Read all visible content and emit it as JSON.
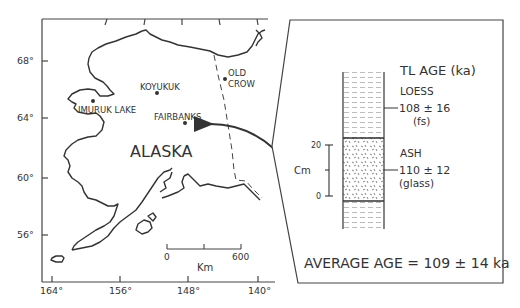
{
  "map": {
    "region_label": "ALASKA",
    "latitude_ticks": [
      "68°",
      "64°",
      "60°",
      "56°"
    ],
    "longitude_ticks": [
      "164°",
      "156°",
      "148°",
      "140°"
    ],
    "places": [
      {
        "name": "KOYUKUK"
      },
      {
        "name": "FAIRBANKS"
      },
      {
        "name": "IMURUK LAKE"
      },
      {
        "name_line1": "OLD",
        "name_line2": "CROW"
      }
    ],
    "scale_bar": {
      "start": "0",
      "end": "600",
      "unit": "Km"
    }
  },
  "section": {
    "title": "TL AGE (ka)",
    "layers": [
      {
        "name": "LOESS",
        "age": "108 ± 16",
        "material": "(fs)"
      },
      {
        "name": "ASH",
        "age": "110 ± 12",
        "material": "(glass)"
      }
    ],
    "depth_scale": {
      "unit": "Cm",
      "top": "20",
      "bottom": "0"
    },
    "average": "AVERAGE AGE = 109 ± 14 ka"
  }
}
